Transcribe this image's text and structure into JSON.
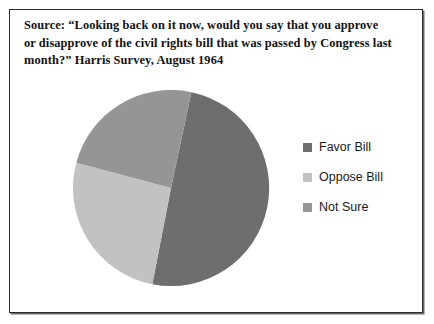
{
  "figure": {
    "background_color": "#ffffff",
    "border_color": "#2b2b2b"
  },
  "caption": {
    "line1": "Source: “Looking back on it now, would you say that you approve",
    "line2": "or disapprove of the civil rights bill that was passed by Congress last",
    "line3": "month?” Harris Survey, August 1964"
  },
  "legend": {
    "items": [
      {
        "label": "Favor Bill",
        "color": "#6e6e6e"
      },
      {
        "label": "Oppose Bill",
        "color": "#c2c2c2"
      },
      {
        "label": "Not Sure",
        "color": "#959595"
      }
    ]
  },
  "chart_data": {
    "type": "pie",
    "title": "",
    "categories": [
      "Favor Bill",
      "Oppose Bill",
      "Not Sure"
    ],
    "values": [
      53,
      26,
      21
    ],
    "colors": [
      "#6e6e6e",
      "#c2c2c2",
      "#959595"
    ],
    "start_angle_deg": 12,
    "direction": "clockwise",
    "legend_position": "right",
    "grid": false,
    "labels_shown": false,
    "slices": [
      {
        "name": "Favor Bill",
        "value": 53,
        "start_deg": 12,
        "end_deg": 191,
        "color": "#6e6e6e"
      },
      {
        "name": "Oppose Bill",
        "value": 26,
        "start_deg": 191,
        "end_deg": 285,
        "color": "#c2c2c2"
      },
      {
        "name": "Not Sure",
        "value": 21,
        "start_deg": 285,
        "end_deg": 372,
        "color": "#959595"
      }
    ]
  }
}
